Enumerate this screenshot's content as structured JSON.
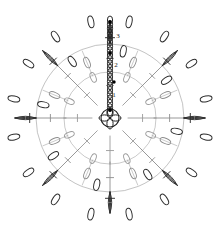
{
  "document": {
    "title": "Crochet Motif Chart",
    "type": "crochet-stitch-diagram",
    "background_color": "#ffffff",
    "width": 219,
    "height": 228
  },
  "colors": {
    "round1_stroke": "#9a9a9a",
    "round2_stroke": "#8c8c8c",
    "round3_stroke": "#2b2b2b",
    "center_stroke": "#1f1f1f",
    "chain_column_stroke": "#1f1f1f",
    "marker_dot": "#000000",
    "label_text": "#1a1a1a",
    "background": "#ffffff"
  },
  "geometry": {
    "center_x": 110,
    "center_y": 118,
    "center_ring_radius": 9,
    "round1_inner_radius": 18,
    "round1_outer_radius": 46,
    "round2_inner_radius": 48,
    "round2_outer_radius": 74,
    "round3_inner_radius": 76,
    "round3_outer_radius": 101,
    "round1_spokes": 8,
    "round2_spokes": 16,
    "round3_clusters": 16
  },
  "labels": [
    {
      "id": "round-label-1",
      "text": "1",
      "x": 114,
      "y": 97,
      "note": "round 1 turning chain marker"
    },
    {
      "id": "round-label-2",
      "text": "2",
      "x": 116,
      "y": 67,
      "note": "round 2 turning chain marker"
    },
    {
      "id": "round-label-3",
      "text": "3",
      "x": 118,
      "y": 38,
      "note": "round 3 turning chain marker"
    }
  ],
  "markers": [
    {
      "id": "start-dot-1",
      "x": 110,
      "y": 110,
      "r": 1.7
    },
    {
      "id": "start-dot-2",
      "x": 114,
      "y": 82,
      "r": 1.7
    },
    {
      "id": "start-dot-3",
      "x": 110,
      "y": 53,
      "r": 1.7
    },
    {
      "id": "start-dot-4",
      "x": 110,
      "y": 22,
      "r": 1.7
    }
  ],
  "legend": {
    "center_ring": "magic-ring",
    "round1_symbol": "double-crochet",
    "round2_symbol": "double-crochet",
    "round3_symbol": "cluster-stitch",
    "connector_symbol": "chain-stitch"
  },
  "chain_column": {
    "x": 110,
    "from_y": 112,
    "to_y": 20,
    "link_count": 22,
    "link_rx": 2.6,
    "link_ry": 4.0
  }
}
